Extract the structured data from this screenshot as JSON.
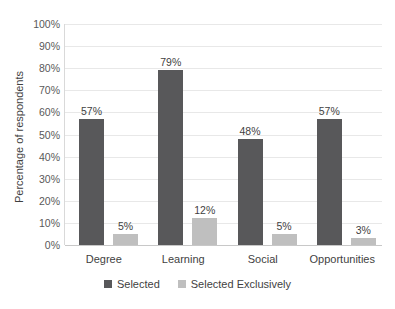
{
  "chart_data": {
    "type": "bar",
    "title": "",
    "xlabel": "",
    "ylabel": "Percentage of respondents",
    "categories": [
      "Degree",
      "Learning",
      "Social",
      "Opportunities"
    ],
    "series": [
      {
        "name": "Selected",
        "color": "#58585a",
        "values": [
          57,
          79,
          48,
          57
        ],
        "labels": [
          "57%",
          "79%",
          "48%",
          "57%"
        ]
      },
      {
        "name": "Selected Exclusively",
        "color": "#bfbfbf",
        "values": [
          5,
          12,
          5,
          3
        ],
        "labels": [
          "5%",
          "12%",
          "5%",
          "3%"
        ]
      }
    ],
    "ylim": [
      0,
      100
    ],
    "ytick_values": [
      0,
      10,
      20,
      30,
      40,
      50,
      60,
      70,
      80,
      90,
      100
    ],
    "ytick_labels": [
      "0%",
      "10%",
      "20%",
      "30%",
      "40%",
      "50%",
      "60%",
      "70%",
      "80%",
      "90%",
      "100%"
    ],
    "grid": true,
    "legend_position": "bottom"
  }
}
